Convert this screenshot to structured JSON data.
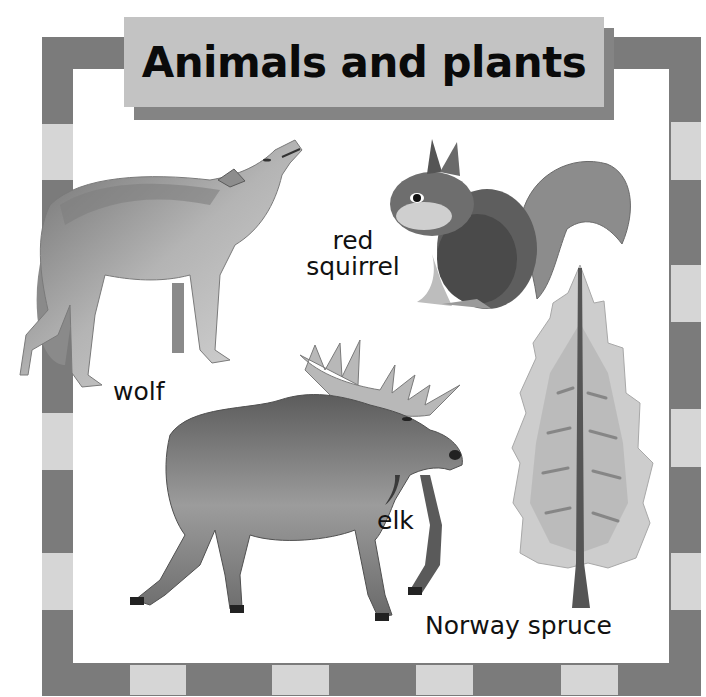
{
  "title": "Animals and plants",
  "colors": {
    "border_dark": "#7b7b7b",
    "border_light": "#d6d6d6",
    "title_box": "#c3c3c3",
    "title_shadow": "#848484",
    "background": "#ffffff",
    "text": "#111111"
  },
  "illustrations": [
    {
      "id": "wolf",
      "label": "wolf",
      "icon": "wolf-illustration"
    },
    {
      "id": "red-squirrel",
      "label_line1": "red",
      "label_line2": "squirrel",
      "icon": "squirrel-illustration"
    },
    {
      "id": "elk",
      "label": "elk",
      "icon": "elk-illustration"
    },
    {
      "id": "norway-spruce",
      "label": "Norway spruce",
      "icon": "spruce-tree-illustration"
    }
  ]
}
